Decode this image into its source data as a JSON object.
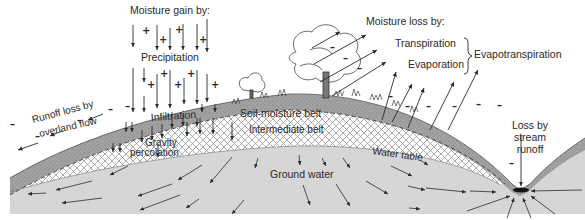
{
  "diagram": {
    "gain": {
      "heading": "Moisture gain by:",
      "source": "Precipitation",
      "sign": "+"
    },
    "loss": {
      "heading": "Moisture loss by:",
      "transpiration": "Transpiration",
      "evaporation": "Evaporation",
      "combined": "Evapotranspiration",
      "sign": "–"
    },
    "runoff": {
      "line1": "Runoff loss by",
      "line2": "overland flow"
    },
    "stream": {
      "line1": "Loss by",
      "line2": "stream",
      "line3": "runoff"
    },
    "zones": {
      "infiltration": "Infiltration",
      "soil_moisture": "Soil-moisture belt",
      "intermediate": "Intermediate belt",
      "gravity_line1": "Gravity",
      "gravity_line2": "percolation",
      "water_table": "Water table",
      "ground_water": "Ground water"
    },
    "colors": {
      "ground_water": "#d6d6d6",
      "soil_belt": "#9c9c9c",
      "hatch": "#8a8a8a",
      "ink": "#2a2a2a"
    }
  }
}
